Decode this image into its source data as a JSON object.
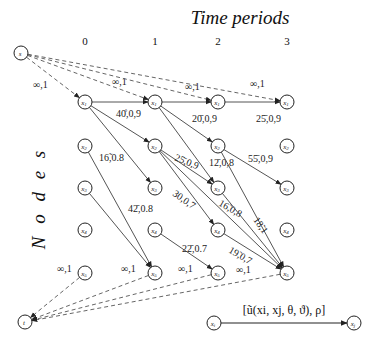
{
  "title": "Time periods",
  "yaxis_title": "N o d e s",
  "time_ticks": [
    "0",
    "1",
    "2",
    "3"
  ],
  "source": {
    "label": "s",
    "x": 21,
    "y": 53
  },
  "sink": {
    "label": "t",
    "x": 25,
    "y": 322
  },
  "columns": [
    85,
    155,
    218,
    287
  ],
  "rows": [
    102,
    146,
    188,
    230,
    273
  ],
  "node_labels": [
    "x1",
    "x2",
    "x3",
    "x4",
    "x5"
  ],
  "source_edges": [
    {
      "to": [
        0,
        0
      ],
      "label": "∞,1",
      "lx": 33,
      "ly": 88
    },
    {
      "to": [
        1,
        0
      ],
      "label": "∞,1",
      "lx": 112,
      "ly": 85
    },
    {
      "to": [
        2,
        0
      ],
      "label": "∞,1",
      "lx": 185,
      "ly": 90
    },
    {
      "to": [
        3,
        0
      ],
      "label": "∞,1",
      "lx": 250,
      "ly": 87
    }
  ],
  "sink_edges": [
    {
      "from": [
        0,
        4
      ],
      "label": "∞,1",
      "lx": 57,
      "ly": 272
    },
    {
      "from": [
        1,
        4
      ],
      "label": "∞,1",
      "lx": 121,
      "ly": 272
    },
    {
      "from": [
        2,
        4
      ],
      "label": "∞,1",
      "lx": 178,
      "ly": 272
    },
    {
      "from": [
        3,
        4
      ],
      "label": "∞,1",
      "lx": 236,
      "ly": 273
    }
  ],
  "edges": [
    {
      "from": [
        0,
        0
      ],
      "to": [
        1,
        0
      ],
      "label": "40̊,0,9",
      "lx": 116,
      "ly": 117,
      "rot": 0
    },
    {
      "from": [
        0,
        0
      ],
      "to": [
        1,
        1
      ],
      "label": "",
      "lx": 0,
      "ly": 0,
      "rot": 0
    },
    {
      "from": [
        0,
        0
      ],
      "to": [
        1,
        2
      ],
      "label": "16̃,0.8",
      "lx": 99,
      "ly": 161,
      "rot": 0
    },
    {
      "from": [
        0,
        1
      ],
      "to": [
        1,
        4
      ],
      "label": "",
      "lx": 0,
      "ly": 0,
      "rot": 0
    },
    {
      "from": [
        0,
        2
      ],
      "to": [
        1,
        4
      ],
      "label": "42̄,0.8",
      "lx": 128,
      "ly": 212,
      "rot": 0
    },
    {
      "from": [
        1,
        0
      ],
      "to": [
        2,
        0
      ],
      "label": "",
      "lx": 0,
      "ly": 0,
      "rot": 0
    },
    {
      "from": [
        1,
        0
      ],
      "to": [
        2,
        1
      ],
      "label": "20̄,0,9",
      "lx": 192,
      "ly": 122,
      "rot": 0
    },
    {
      "from": [
        1,
        0
      ],
      "to": [
        2,
        2
      ],
      "label": "12̄,0,8",
      "lx": 209,
      "ly": 166,
      "rot": 0
    },
    {
      "from": [
        1,
        1
      ],
      "to": [
        2,
        2
      ],
      "label": "25̄,0,9",
      "lx": 174,
      "ly": 160,
      "rot": 22
    },
    {
      "from": [
        1,
        1
      ],
      "to": [
        2,
        3
      ],
      "label": "30,0,7",
      "lx": 172,
      "ly": 195,
      "rot": 35
    },
    {
      "from": [
        1,
        1
      ],
      "to": [
        3,
        4
      ],
      "label": "16̃,0,8",
      "lx": 218,
      "ly": 205,
      "rot": 30
    },
    {
      "from": [
        1,
        3
      ],
      "to": [
        2,
        4
      ],
      "label": "22̄,0.7",
      "lx": 182,
      "ly": 252,
      "rot": 0
    },
    {
      "from": [
        2,
        0
      ],
      "to": [
        3,
        0
      ],
      "label": "25̄,0,9",
      "lx": 256,
      "ly": 122,
      "rot": 0
    },
    {
      "from": [
        2,
        1
      ],
      "to": [
        3,
        2
      ],
      "label": "55̄,0,9",
      "lx": 248,
      "ly": 162,
      "rot": 0
    },
    {
      "from": [
        2,
        1
      ],
      "to": [
        3,
        4
      ],
      "label": "18̃,1",
      "lx": 253,
      "ly": 220,
      "rot": 55
    },
    {
      "from": [
        2,
        2
      ],
      "to": [
        3,
        4
      ],
      "label": "",
      "lx": 0,
      "ly": 0,
      "rot": 0
    },
    {
      "from": [
        2,
        3
      ],
      "to": [
        3,
        4
      ],
      "label": "19̃,0,7",
      "lx": 228,
      "ly": 252,
      "rot": 30
    }
  ],
  "legend": {
    "from_label": "xi",
    "to_label": "xj",
    "edge_label": "[ũ(xi, xj, θ, ϑ), ρ]",
    "x1": 214,
    "x2": 354,
    "y": 323
  },
  "colors": {
    "line": "#555555",
    "dash": "#666666",
    "text": "#222222"
  }
}
